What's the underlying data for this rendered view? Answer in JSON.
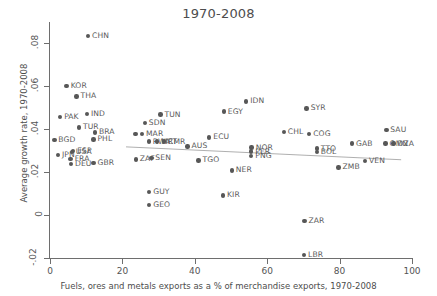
{
  "chart_data": {
    "type": "scatter",
    "title": "1970-2008",
    "xlabel": "Fuels, ores and metals exports as a % of merchandise exports, 1970-2008",
    "ylabel": "Average growth rate, 1970-2008",
    "xlim": [
      0,
      100
    ],
    "ylim": [
      -0.02,
      0.09
    ],
    "xticks": [
      "0",
      "20",
      "40",
      "60",
      "80",
      "100"
    ],
    "xtickvals": [
      0,
      20,
      40,
      60,
      80,
      100
    ],
    "yticks": [
      "-.02",
      "0",
      ".02",
      ".04",
      ".06",
      ".08"
    ],
    "ytickvals": [
      -0.02,
      0,
      0.02,
      0.04,
      0.06,
      0.08
    ],
    "grid": false,
    "legend": "none",
    "fit_line": {
      "type": "linear",
      "x0": 21,
      "y0": 0.0318,
      "x1": 97,
      "y1": 0.0258
    },
    "points": [
      {
        "label": "CHN",
        "x": 10.5,
        "y": 0.0835
      },
      {
        "label": "KOR",
        "x": 4.6,
        "y": 0.0601
      },
      {
        "label": "THA",
        "x": 7.3,
        "y": 0.0553
      },
      {
        "label": "IDN",
        "x": 54.2,
        "y": 0.053
      },
      {
        "label": "SYR",
        "x": 70.9,
        "y": 0.0497
      },
      {
        "label": "EGY",
        "x": 48.0,
        "y": 0.0482
      },
      {
        "label": "PAK",
        "x": 2.8,
        "y": 0.0456
      },
      {
        "label": "IND",
        "x": 10.2,
        "y": 0.047
      },
      {
        "label": "TUN",
        "x": 30.5,
        "y": 0.0468
      },
      {
        "label": "SDN",
        "x": 26.2,
        "y": 0.0428
      },
      {
        "label": "SAU",
        "x": 92.9,
        "y": 0.0396
      },
      {
        "label": "TUR",
        "x": 8.0,
        "y": 0.0409
      },
      {
        "label": "CHL",
        "x": 64.6,
        "y": 0.0388
      },
      {
        "label": "COG",
        "x": 71.6,
        "y": 0.0378
      },
      {
        "label": "BRA",
        "x": 12.4,
        "y": 0.0385
      },
      {
        "label": "MAR",
        "x": 25.4,
        "y": 0.0378
      },
      {
        "label": "BOL2",
        "x": 23.6,
        "y": 0.0378
      },
      {
        "label": "ECU",
        "x": 44.0,
        "y": 0.0362
      },
      {
        "label": "BGD",
        "x": 1.2,
        "y": 0.035
      },
      {
        "label": "PHL",
        "x": 12.0,
        "y": 0.0353
      },
      {
        "label": "RWA",
        "x": 27.3,
        "y": 0.0343
      },
      {
        "label": "CMR",
        "x": 31.5,
        "y": 0.0343
      },
      {
        "label": "MRT",
        "x": 29.6,
        "y": 0.0343
      },
      {
        "label": "GAB",
        "x": 83.4,
        "y": 0.0333
      },
      {
        "label": "DZA",
        "x": 94.9,
        "y": 0.0333
      },
      {
        "label": "OMN",
        "x": 92.7,
        "y": 0.0333
      },
      {
        "label": "TTO",
        "x": 73.7,
        "y": 0.031
      },
      {
        "label": "NOR",
        "x": 55.7,
        "y": 0.0315
      },
      {
        "label": "AUS",
        "x": 38.0,
        "y": 0.032
      },
      {
        "label": "ESP",
        "x": 6.4,
        "y": 0.03
      },
      {
        "label": "USA",
        "x": 6.0,
        "y": 0.0295
      },
      {
        "label": "PER",
        "x": 55.6,
        "y": 0.0296
      },
      {
        "label": "BOL",
        "x": 73.7,
        "y": 0.0295
      },
      {
        "label": "JPN",
        "x": 2.2,
        "y": 0.028
      },
      {
        "label": "PNG",
        "x": 55.6,
        "y": 0.0276
      },
      {
        "label": "SEN",
        "x": 28.0,
        "y": 0.0267
      },
      {
        "label": "FRA",
        "x": 5.7,
        "y": 0.0262
      },
      {
        "label": "ZAF",
        "x": 23.7,
        "y": 0.026
      },
      {
        "label": "TGO",
        "x": 41.0,
        "y": 0.0255
      },
      {
        "label": "VEN",
        "x": 87.0,
        "y": 0.0253
      },
      {
        "label": "GBR",
        "x": 12.0,
        "y": 0.0243
      },
      {
        "label": "DEU",
        "x": 5.8,
        "y": 0.0238
      },
      {
        "label": "ZMB",
        "x": 79.7,
        "y": 0.0222
      },
      {
        "label": "NER",
        "x": 50.2,
        "y": 0.0208
      },
      {
        "label": "GUY",
        "x": 27.4,
        "y": 0.0108
      },
      {
        "label": "KIR",
        "x": 47.8,
        "y": 0.0092
      },
      {
        "label": "GEO",
        "x": 27.4,
        "y": 0.0048
      },
      {
        "label": "ZAR",
        "x": 70.3,
        "y": -0.0028
      },
      {
        "label": "LBR",
        "x": 70.2,
        "y": -0.0185
      }
    ]
  }
}
